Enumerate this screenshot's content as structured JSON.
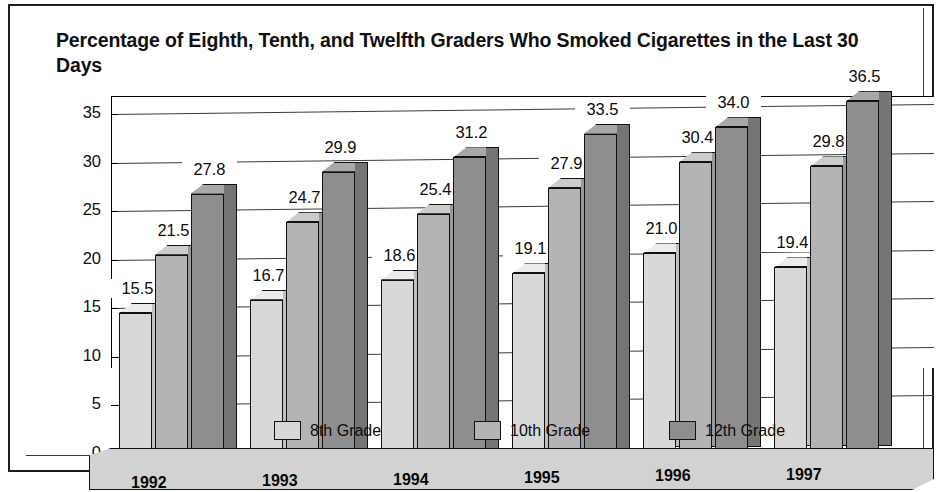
{
  "chart_data": {
    "type": "bar",
    "title": "Percentage of Eighth, Tenth, and Twelfth Graders Who Smoked Cigarettes in the Last 30 Days",
    "xlabel": "",
    "ylabel": "",
    "ylim": [
      0,
      35
    ],
    "yticks": [
      "0",
      "5",
      "10",
      "15",
      "20",
      "25",
      "30",
      "35"
    ],
    "grid": true,
    "legend_position": "bottom",
    "categories": [
      "1992",
      "1993",
      "1994",
      "1995",
      "1996",
      "1997"
    ],
    "series": [
      {
        "name": "8th Grade",
        "color": "#d8d8d8",
        "values": [
          15.5,
          16.7,
          18.6,
          19.1,
          21.0,
          19.4
        ]
      },
      {
        "name": "10th Grade",
        "color": "#b4b4b4",
        "values": [
          21.5,
          24.7,
          25.4,
          27.9,
          30.4,
          29.8
        ]
      },
      {
        "name": "12th Grade",
        "color": "#8e8e8e",
        "values": [
          27.8,
          29.9,
          31.2,
          33.5,
          34.0,
          36.5
        ]
      }
    ],
    "data_labels": [
      [
        "15.5",
        "21.5",
        "27.8"
      ],
      [
        "16.7",
        "24.7",
        "29.9"
      ],
      [
        "18.6",
        "25.4",
        "31.2"
      ],
      [
        "19.1",
        "27.9",
        "33.5"
      ],
      [
        "21.0",
        "30.4",
        "34.0"
      ],
      [
        "19.4",
        "29.8",
        "36.5"
      ]
    ]
  },
  "legend": {
    "items": [
      {
        "label": "8th Grade"
      },
      {
        "label": "10th Grade"
      },
      {
        "label": "12th Grade"
      }
    ]
  }
}
